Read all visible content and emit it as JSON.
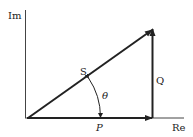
{
  "diagram": {
    "axes": {
      "y_label": "Im",
      "x_label": "Re"
    },
    "vectors": {
      "S": "S",
      "P": "P",
      "Q": "Q"
    },
    "angle_label": "θ",
    "colors": {
      "line": "#222222",
      "background": "#ffffff"
    }
  }
}
